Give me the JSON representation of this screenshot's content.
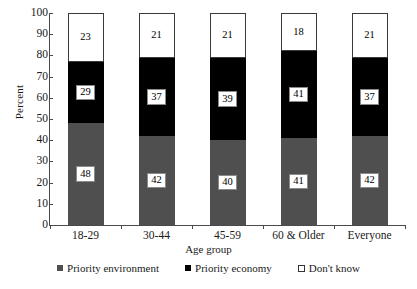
{
  "chart_data": {
    "type": "bar",
    "subtype": "stacked-vertical-100",
    "title": "",
    "subtitle": "",
    "xlabel": "Age group",
    "ylabel": "Percent",
    "ylim": [
      0,
      100
    ],
    "yticks": [
      100,
      90,
      80,
      70,
      60,
      50,
      40,
      30,
      20,
      10,
      0
    ],
    "grid": false,
    "legend_position": "bottom",
    "categories": [
      "18-29",
      "30-44",
      "45-59",
      "60 & Older",
      "Everyone"
    ],
    "series": [
      {
        "name": "Priority environment",
        "color": "#4f4f4f",
        "values": [
          48,
          42,
          40,
          41,
          42
        ]
      },
      {
        "name": "Priority economy",
        "color": "#000000",
        "values": [
          29,
          37,
          39,
          41,
          37
        ]
      },
      {
        "name": "Don't know",
        "color": "#ffffff",
        "values": [
          23,
          21,
          21,
          18,
          21
        ]
      }
    ]
  },
  "axes": {
    "ylabel": "Percent",
    "xlabel": "Age group",
    "yticks": [
      "100",
      "90",
      "80",
      "70",
      "60",
      "50",
      "40",
      "30",
      "20",
      "10",
      "0"
    ],
    "xticks": [
      "18-29",
      "30-44",
      "45-59",
      "60 & Older",
      "Everyone"
    ]
  },
  "legend": {
    "items": [
      {
        "label": "Priority environment",
        "swatch": "filled-dark-gray-square"
      },
      {
        "label": "Priority economy",
        "swatch": "filled-black-square"
      },
      {
        "label": "Don't know",
        "swatch": "outlined-white-square"
      }
    ]
  },
  "bars": [
    {
      "category": "18-29",
      "segments": [
        {
          "series": "Priority environment",
          "value": "48"
        },
        {
          "series": "Priority economy",
          "value": "29"
        },
        {
          "series": "Don't know",
          "value": "23"
        }
      ]
    },
    {
      "category": "30-44",
      "segments": [
        {
          "series": "Priority environment",
          "value": "42"
        },
        {
          "series": "Priority economy",
          "value": "37"
        },
        {
          "series": "Don't know",
          "value": "21"
        }
      ]
    },
    {
      "category": "45-59",
      "segments": [
        {
          "series": "Priority environment",
          "value": "40"
        },
        {
          "series": "Priority economy",
          "value": "39"
        },
        {
          "series": "Don't know",
          "value": "21"
        }
      ]
    },
    {
      "category": "60 & Older",
      "segments": [
        {
          "series": "Priority environment",
          "value": "41"
        },
        {
          "series": "Priority economy",
          "value": "41"
        },
        {
          "series": "Don't know",
          "value": "18"
        }
      ]
    },
    {
      "category": "Everyone",
      "segments": [
        {
          "series": "Priority environment",
          "value": "42"
        },
        {
          "series": "Priority economy",
          "value": "37"
        },
        {
          "series": "Don't know",
          "value": "21"
        }
      ]
    }
  ],
  "colors": {
    "environment": "#4f4f4f",
    "economy": "#000000",
    "dont_know": "#ffffff",
    "axis": "#4a4a4a",
    "background": "#ffffff"
  }
}
